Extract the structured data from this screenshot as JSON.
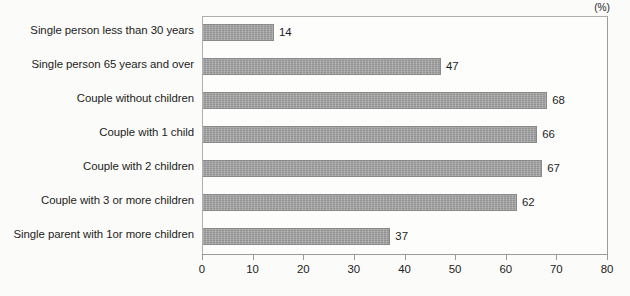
{
  "chart_data": {
    "type": "bar",
    "orientation": "horizontal",
    "title": "",
    "subtitle": "",
    "xlabel": "",
    "ylabel": "",
    "unit_note": "(%)",
    "categories": [
      "Single person less than 30 years",
      "Single person 65 years and over",
      "Couple without children",
      "Couple with 1 child",
      "Couple with 2 children",
      "Couple with 3 or more children",
      "Single parent with 1or more children"
    ],
    "values": [
      14,
      47,
      68,
      66,
      67,
      62,
      37
    ],
    "value_labels": [
      "14",
      "47",
      "68",
      "66",
      "67",
      "62",
      "37"
    ],
    "xlim": [
      0,
      80
    ],
    "xticks": [
      0,
      10,
      20,
      30,
      40,
      50,
      60,
      70,
      80
    ],
    "xtick_labels": [
      "0",
      "10",
      "20",
      "30",
      "40",
      "50",
      "60",
      "70",
      "80"
    ],
    "grid": false,
    "legend": false,
    "legend_position": "none",
    "bar_color": "#a2a2a2",
    "bar_edge_color": "#8a8a8a",
    "axis_color": "#9a9a9a",
    "background_color": "#fbfbf9",
    "text_color": "#1c1c1c"
  }
}
